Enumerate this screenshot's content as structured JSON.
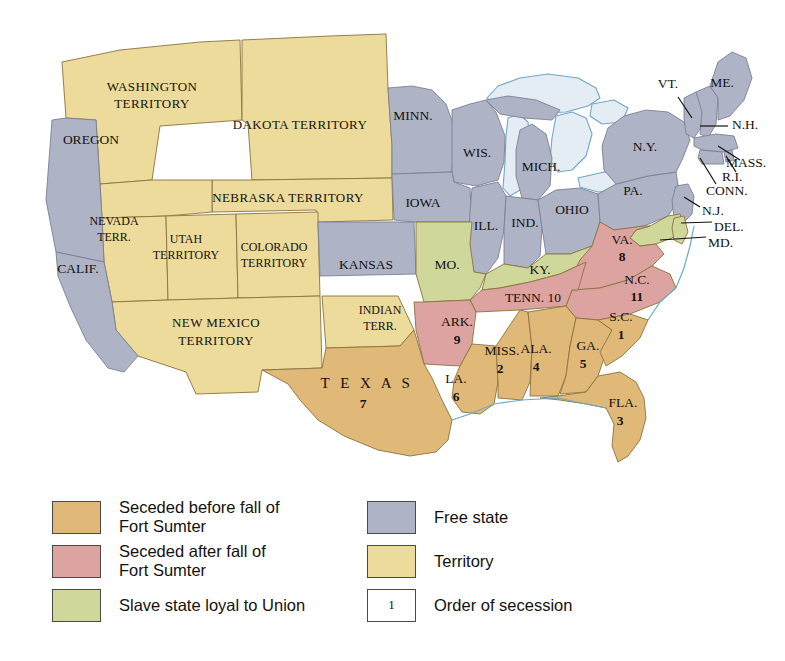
{
  "map": {
    "title": "Secession of the Southern States",
    "colors": {
      "seceded_before": "#e0b878",
      "seceded_after": "#dda3a0",
      "loyal_slave_state": "#cfd79b",
      "free_state": "#aeb3c6",
      "territory": "#ecdb9a",
      "water": "#e4ecf4",
      "border": "#8a7340",
      "text": "#14110d"
    },
    "regions": [
      {
        "id": "washington-territory",
        "label": "WASHINGTON\nTERRITORY",
        "category": "territory"
      },
      {
        "id": "oregon",
        "label": "OREGON",
        "category": "free_state"
      },
      {
        "id": "dakota-territory",
        "label": "DAKOTA TERRITORY",
        "category": "territory"
      },
      {
        "id": "nebraska-territory",
        "label": "NEBRASKA TERRITORY",
        "category": "territory"
      },
      {
        "id": "nevada-territory",
        "label": "NEVADA\nTERR.",
        "category": "territory"
      },
      {
        "id": "utah-territory",
        "label": "UTAH\nTERRITORY",
        "category": "territory"
      },
      {
        "id": "colorado-territory",
        "label": "COLORADO\nTERRITORY",
        "category": "territory"
      },
      {
        "id": "new-mexico-territory",
        "label": "NEW MEXICO\nTERRITORY",
        "category": "territory"
      },
      {
        "id": "indian-territory",
        "label": "INDIAN\nTERR.",
        "category": "territory"
      },
      {
        "id": "california",
        "label": "CALIF.",
        "category": "free_state"
      },
      {
        "id": "kansas",
        "label": "KANSAS",
        "category": "free_state"
      },
      {
        "id": "minnesota",
        "label": "MINN.",
        "category": "free_state"
      },
      {
        "id": "wisconsin",
        "label": "WIS.",
        "category": "free_state"
      },
      {
        "id": "iowa",
        "label": "IOWA",
        "category": "free_state"
      },
      {
        "id": "illinois",
        "label": "ILL.",
        "category": "free_state"
      },
      {
        "id": "michigan",
        "label": "MICH.",
        "category": "free_state"
      },
      {
        "id": "indiana",
        "label": "IND.",
        "category": "free_state"
      },
      {
        "id": "ohio",
        "label": "OHIO",
        "category": "free_state"
      },
      {
        "id": "pennsylvania",
        "label": "PA.",
        "category": "free_state"
      },
      {
        "id": "new-york",
        "label": "N.Y.",
        "category": "free_state"
      },
      {
        "id": "vermont",
        "label": "VT.",
        "category": "free_state"
      },
      {
        "id": "maine",
        "label": "ME.",
        "category": "free_state"
      },
      {
        "id": "new-hampshire",
        "label": "N.H.",
        "category": "free_state"
      },
      {
        "id": "massachusetts",
        "label": "MASS.",
        "category": "free_state"
      },
      {
        "id": "rhode-island",
        "label": "R.I.",
        "category": "free_state"
      },
      {
        "id": "connecticut",
        "label": "CONN.",
        "category": "free_state"
      },
      {
        "id": "new-jersey",
        "label": "N.J.",
        "category": "free_state"
      },
      {
        "id": "delaware",
        "label": "DEL.",
        "category": "loyal_slave_state"
      },
      {
        "id": "maryland",
        "label": "MD.",
        "category": "loyal_slave_state"
      },
      {
        "id": "missouri",
        "label": "MO.",
        "category": "loyal_slave_state"
      },
      {
        "id": "kentucky",
        "label": "KY.",
        "category": "loyal_slave_state"
      },
      {
        "id": "virginia",
        "label": "VA.",
        "category": "seceded_after",
        "order": "8"
      },
      {
        "id": "north-carolina",
        "label": "N.C.",
        "category": "seceded_after",
        "order": "11"
      },
      {
        "id": "tennessee",
        "label": "TENN.",
        "category": "seceded_after",
        "order": "10"
      },
      {
        "id": "arkansas",
        "label": "ARK.",
        "category": "seceded_after",
        "order": "9"
      },
      {
        "id": "south-carolina",
        "label": "S.C.",
        "category": "seceded_before",
        "order": "1"
      },
      {
        "id": "mississippi",
        "label": "MISS.",
        "category": "seceded_before",
        "order": "2"
      },
      {
        "id": "florida",
        "label": "FLA.",
        "category": "seceded_before",
        "order": "3"
      },
      {
        "id": "alabama",
        "label": "ALA.",
        "category": "seceded_before",
        "order": "4"
      },
      {
        "id": "georgia",
        "label": "GA.",
        "category": "seceded_before",
        "order": "5"
      },
      {
        "id": "louisiana",
        "label": "LA.",
        "category": "seceded_before",
        "order": "6"
      },
      {
        "id": "texas",
        "label": "TEXAS",
        "category": "seceded_before",
        "order": "7"
      }
    ],
    "labels": {
      "washington_territory_l1": "WASHINGTON",
      "washington_territory_l2": "TERRITORY",
      "oregon": "OREGON",
      "dakota_territory": "DAKOTA TERRITORY",
      "nebraska_territory": "NEBRASKA TERRITORY",
      "nevada_l1": "NEVADA",
      "nevada_l2": "TERR.",
      "utah_l1": "UTAH",
      "utah_l2": "TERRITORY",
      "colorado_l1": "COLORADO",
      "colorado_l2": "TERRITORY",
      "new_mexico_l1": "NEW MEXICO",
      "new_mexico_l2": "TERRITORY",
      "indian_l1": "INDIAN",
      "indian_l2": "TERR.",
      "california": "CALIF.",
      "kansas": "KANSAS",
      "minnesota": "MINN.",
      "wisconsin": "WIS.",
      "iowa": "IOWA",
      "illinois": "ILL.",
      "michigan": "MICH.",
      "indiana": "IND.",
      "ohio": "OHIO",
      "pennsylvania": "PA.",
      "new_york": "N.Y.",
      "vermont": "VT.",
      "maine": "ME.",
      "new_hampshire": "N.H.",
      "massachusetts": "MASS.",
      "rhode_island": "R.I.",
      "connecticut": "CONN.",
      "new_jersey": "N.J.",
      "delaware": "DEL.",
      "maryland": "MD.",
      "missouri": "MO.",
      "kentucky": "KY.",
      "virginia": "VA.",
      "virginia_num": "8",
      "north_carolina": "N.C.",
      "north_carolina_num": "11",
      "tennessee": "TENN. 10",
      "arkansas": "ARK.",
      "arkansas_num": "9",
      "south_carolina": "S.C.",
      "south_carolina_num": "1",
      "mississippi": "MISS.",
      "mississippi_num": "2",
      "florida": "FLA.",
      "florida_num": "3",
      "alabama": "ALA.",
      "alabama_num": "4",
      "georgia": "GA.",
      "georgia_num": "5",
      "louisiana": "LA.",
      "louisiana_num": "6",
      "texas": "T E X A S",
      "texas_num": "7"
    }
  },
  "legend": {
    "items_left": [
      {
        "id": "seceded-before",
        "swatch": "before",
        "label": "Seceded before fall of\nFort Sumter"
      },
      {
        "id": "seceded-after",
        "swatch": "after",
        "label": "Seceded after fall of\nFort Sumter"
      },
      {
        "id": "loyal-slave-state",
        "swatch": "loyal",
        "label": "Slave state loyal to Union"
      }
    ],
    "items_right": [
      {
        "id": "free-state",
        "swatch": "free",
        "label": "Free state"
      },
      {
        "id": "territory",
        "swatch": "terr",
        "label": "Territory"
      },
      {
        "id": "order-of-secession",
        "swatch": "order",
        "sample": "1",
        "label": "Order of secession"
      }
    ]
  }
}
